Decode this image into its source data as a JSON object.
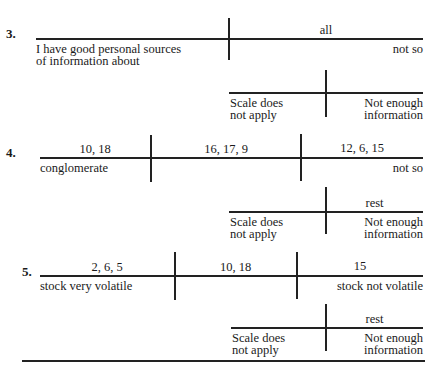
{
  "items": [
    {
      "number": "3.",
      "left_label": [
        "I have good personal sources",
        "of information about"
      ],
      "right_label": "not so",
      "segments": [
        {
          "value": ""
        },
        {
          "value": "all"
        }
      ],
      "sub": {
        "left_label": [
          "Scale does",
          "not apply"
        ],
        "right_label": [
          "Not enough",
          "information"
        ],
        "right_value": ""
      }
    },
    {
      "number": "4.",
      "left_label": [
        "conglomerate"
      ],
      "right_label": "not so",
      "segments": [
        {
          "value": "10, 18"
        },
        {
          "value": "16, 17, 9"
        },
        {
          "value": "12, 6, 15"
        }
      ],
      "sub": {
        "left_label": [
          "Scale does",
          "not apply"
        ],
        "right_label": [
          "Not enough",
          "information"
        ],
        "right_value": "rest"
      }
    },
    {
      "number": "5.",
      "left_label": [
        "stock very volatile"
      ],
      "right_label": "stock not volatile",
      "segments": [
        {
          "value": "2, 6, 5"
        },
        {
          "value": "10, 18"
        },
        {
          "value": "15"
        }
      ],
      "sub": {
        "left_label": [
          "Scale does",
          "not apply"
        ],
        "right_label": [
          "Not enough",
          "information"
        ],
        "right_value": "rest"
      }
    }
  ]
}
